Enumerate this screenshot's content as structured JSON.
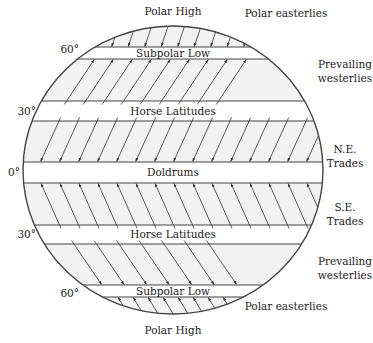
{
  "diagram": {
    "title_top": "Polar High",
    "title_bottom": "Polar High",
    "colors": {
      "outline": "#444444",
      "band_fill": "#f2f2f2",
      "calm_fill": "#ffffff",
      "arrow": "#333333",
      "text": "#222222"
    },
    "circle": {
      "cx": 173,
      "cy": 170,
      "rx": 150,
      "ry": 144
    },
    "latitude_labels": [
      {
        "text": "60°",
        "x": 79,
        "y": 53
      },
      {
        "text": "30°",
        "x": 36,
        "y": 115
      },
      {
        "text": "0°",
        "x": 20,
        "y": 176
      },
      {
        "text": "30°",
        "x": 36,
        "y": 238
      },
      {
        "text": "60°",
        "x": 79,
        "y": 297
      }
    ],
    "calm_belts": [
      {
        "name": "Subpolar Low",
        "y_top": 47,
        "y_bottom": 59,
        "label_y": 57
      },
      {
        "name": "Horse Latitudes",
        "y_top": 101,
        "y_bottom": 121,
        "label_y": 115
      },
      {
        "name": "Doldrums",
        "y_top": 162,
        "y_bottom": 183,
        "label_y": 176
      },
      {
        "name": "Horse Latitudes",
        "y_top": 225,
        "y_bottom": 244,
        "label_y": 238
      },
      {
        "name": "Subpolar Low",
        "y_top": 285,
        "y_bottom": 297,
        "label_y": 295
      }
    ],
    "wind_belts": [
      {
        "name": "Polar easterlies",
        "label_lines": [
          "Polar easterlies"
        ],
        "label_x": 286,
        "label_y": 17,
        "y_top": 26,
        "y_bottom": 47,
        "direction": "down-left",
        "arrow_at": "bottom",
        "spacing": 16.5,
        "dx": -8
      },
      {
        "name": "Prevailing westerlies",
        "label_lines": [
          "Prevailing",
          "westerlies"
        ],
        "label_x": 345,
        "label_y": 68,
        "y_top": 59,
        "y_bottom": 101,
        "direction": "up-right",
        "arrow_at": "top",
        "spacing": 19,
        "dx": 30
      },
      {
        "name": "N.E. Trades",
        "label_lines": [
          "N.E.",
          "Trades"
        ],
        "label_x": 345,
        "label_y": 153,
        "y_top": 121,
        "y_bottom": 162,
        "direction": "down-left",
        "arrow_at": "bottom",
        "spacing": 19,
        "dx": -20
      },
      {
        "name": "S.E. Trades",
        "label_lines": [
          "S.E.",
          "Trades"
        ],
        "label_x": 345,
        "label_y": 211,
        "y_top": 183,
        "y_bottom": 225,
        "direction": "up-left",
        "arrow_at": "top",
        "spacing": 19,
        "dx": -20
      },
      {
        "name": "Prevailing westerlies",
        "label_lines": [
          "Prevailing",
          "westerlies"
        ],
        "label_x": 345,
        "label_y": 265,
        "y_top": 244,
        "y_bottom": 285,
        "direction": "down-right",
        "arrow_at": "bottom",
        "spacing": 22.5,
        "dx": 30
      },
      {
        "name": "Polar easterlies",
        "label_lines": [
          "Polar easterlies"
        ],
        "label_x": 286,
        "label_y": 310,
        "y_top": 297,
        "y_bottom": 314,
        "direction": "up-left",
        "arrow_at": "top",
        "spacing": 15,
        "dx": -12
      }
    ]
  }
}
